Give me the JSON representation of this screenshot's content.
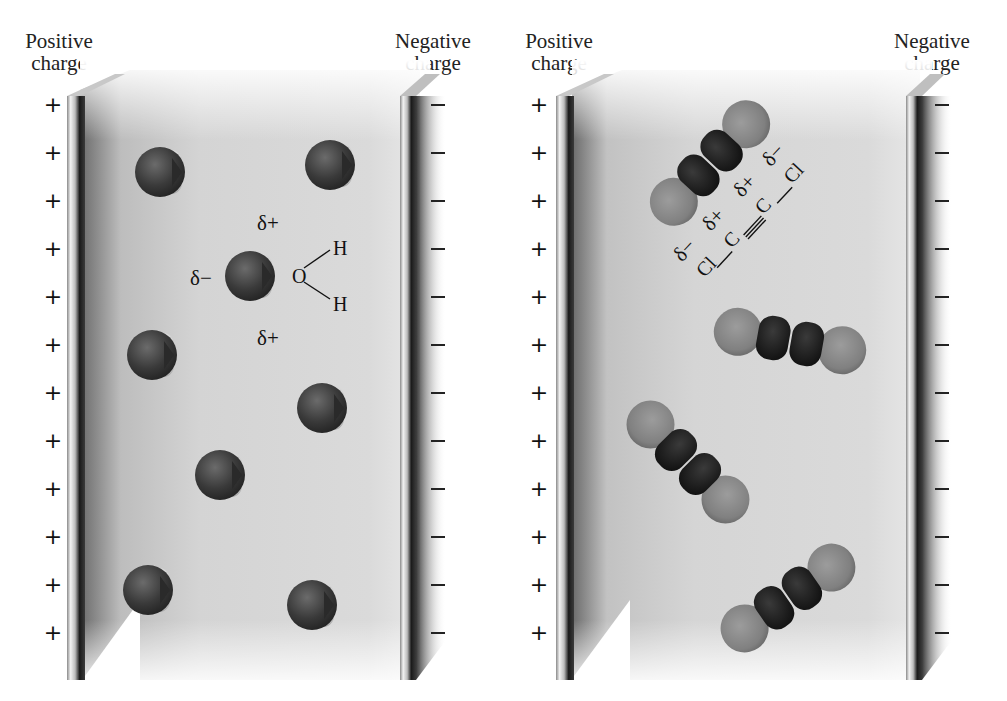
{
  "panels": [
    {
      "id": "water",
      "positive_label": [
        "Positive",
        "charge"
      ],
      "negative_label": [
        "Negative",
        "charge"
      ],
      "plus_sign": "+",
      "sign_count": 12,
      "molecule": "H2O",
      "structure": {
        "center_atom": "O",
        "top_atom": "H",
        "bottom_atom": "H",
        "delta_top": "δ+",
        "delta_bottom": "δ+",
        "delta_left": "δ−"
      }
    },
    {
      "id": "dichloroacetylene",
      "positive_label": [
        "Positive",
        "charge"
      ],
      "negative_label": [
        "Negative",
        "charge"
      ],
      "plus_sign": "+",
      "sign_count": 12,
      "molecule": "Cl—C≡C—Cl",
      "structure": {
        "atoms": [
          "Cl",
          "C",
          "C",
          "Cl"
        ],
        "deltas": [
          "δ−",
          "δ+",
          "δ+",
          "δ−"
        ]
      }
    }
  ],
  "colors": {
    "background": "#ffffff",
    "field": "#d6d6d6",
    "oxygen": "#3a3a3a",
    "hydrogen": "#d8d8d8",
    "chlorine": "#8a8a8a",
    "carbon": "#1c1c1c",
    "plate_dark": "#1a1a1a"
  }
}
